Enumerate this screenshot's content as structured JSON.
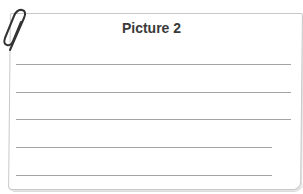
{
  "card": {
    "title": "Picture 2",
    "writing_lines": [
      {
        "y": 64,
        "width": 275
      },
      {
        "y": 92,
        "width": 275
      },
      {
        "y": 119,
        "width": 275
      },
      {
        "y": 147,
        "width": 256
      },
      {
        "y": 175,
        "width": 256
      }
    ],
    "icons": {
      "clip": "paperclip-icon"
    },
    "colors": {
      "line": "#a3a3a3",
      "border": "#c9c9c9",
      "title": "#3a3a3a",
      "clip": "#333333"
    }
  }
}
